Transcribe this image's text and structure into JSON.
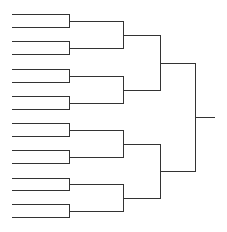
{
  "diagram": {
    "type": "single-elimination-bracket",
    "teams": 16,
    "rounds": 4,
    "line_color": "#333333",
    "background": "#ffffff",
    "labels": []
  },
  "layout": {
    "entry_slots_y": [
      14,
      27,
      41,
      54,
      69,
      82,
      96,
      109,
      123,
      136,
      150,
      163,
      178,
      190,
      204,
      217
    ],
    "round_x": [
      12,
      69,
      123,
      160,
      195,
      214
    ]
  }
}
